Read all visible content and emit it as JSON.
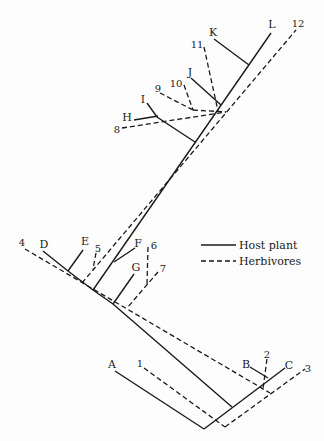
{
  "figure": {
    "host_plant_taxa": [
      "A",
      "B",
      "C",
      "D",
      "E",
      "F",
      "G",
      "H",
      "I",
      "J",
      "K",
      "L"
    ],
    "herbivore_taxa": [
      "1",
      "2",
      "3",
      "4",
      "5",
      "6",
      "7",
      "8",
      "9",
      "10",
      "11",
      "12"
    ],
    "legend": [
      {
        "label": "Host plant",
        "line_style": "solid"
      },
      {
        "label": "Herbivores",
        "line_style": "dashed"
      }
    ],
    "line_color": "#1a1a1a",
    "background_color": "#fdfdfd"
  }
}
